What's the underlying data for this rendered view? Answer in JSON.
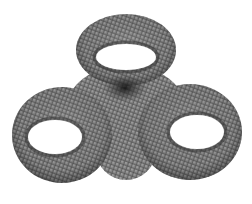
{
  "figure": {
    "subject": "triple torus mesh",
    "background_color": "#ffffff",
    "surface_color": "#7a7a7a",
    "mesh_line_color": "#3a3a3a",
    "shadow_color": "#2a2a2a",
    "holes": [
      {
        "name": "top",
        "cx": 126,
        "cy": 57,
        "rx": 30,
        "ry": 13
      },
      {
        "name": "left",
        "cx": 55,
        "cy": 137,
        "rx": 27,
        "ry": 17
      },
      {
        "name": "right",
        "cx": 197,
        "cy": 132,
        "rx": 27,
        "ry": 17
      }
    ]
  }
}
